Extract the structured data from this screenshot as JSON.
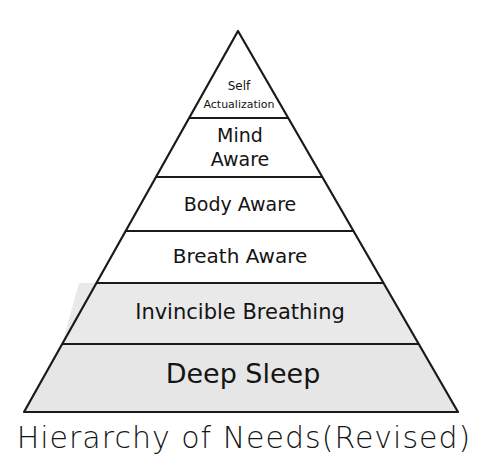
{
  "diagram": {
    "type": "pyramid",
    "title_display": "Hierarchy of Needs(Revised)",
    "colors": {
      "outline": "#1a1a1a",
      "fill_white": "#ffffff",
      "fill_gray": "#e8e8e8",
      "text": "#141414"
    },
    "tiers_top_to_bottom": [
      {
        "level": 6,
        "lines": [
          "Self",
          "Actualization"
        ],
        "fill": "white"
      },
      {
        "level": 5,
        "lines": [
          "Mind",
          "Aware"
        ],
        "fill": "white"
      },
      {
        "level": 4,
        "lines": [
          "Body Aware"
        ],
        "fill": "white"
      },
      {
        "level": 3,
        "lines": [
          "Breath Aware"
        ],
        "fill": "white"
      },
      {
        "level": 2,
        "lines": [
          "Invincible Breathing"
        ],
        "fill": "gray"
      },
      {
        "level": 1,
        "lines": [
          "Deep Sleep"
        ],
        "fill": "gray"
      }
    ]
  },
  "labels": {
    "t0a": "Self",
    "t0b": "Actualization",
    "t1a": "Mind",
    "t1b": "Aware",
    "t2": "Body Aware",
    "t3": "Breath Aware",
    "t4": "Invincible Breathing",
    "t5": "Deep Sleep",
    "caption": "Hierarchy of Needs(Revised)"
  }
}
